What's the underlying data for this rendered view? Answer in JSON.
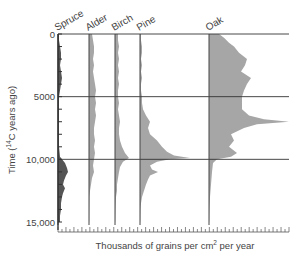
{
  "chart_data": {
    "type": "area",
    "subtype": "pollen-diagram",
    "title": "",
    "xlabel": "Thousands of grains per cm² per year",
    "xlabel_parts": {
      "before": "Thousands of grains per cm",
      "sup": "2",
      "after": " per year"
    },
    "ylabel": "Time (14C years ago)",
    "ylabel_parts": {
      "before": "Time (",
      "sup": "14",
      "after": "C years ago)"
    },
    "y_ticks": [
      {
        "value": 0,
        "label": "0"
      },
      {
        "value": 5000,
        "label": "5000"
      },
      {
        "value": 10000,
        "label": "10,000"
      },
      {
        "value": 15000,
        "label": "15,000"
      }
    ],
    "ylim": [
      0,
      15000
    ],
    "y_inverted": true,
    "grid_lines_at": [
      0,
      5000,
      10000
    ],
    "legend": "none",
    "series": [
      {
        "name": "Spruce",
        "color": "#555555",
        "baseline_px": 58,
        "depth": [
          0,
          500,
          1000,
          1500,
          2000,
          2500,
          3000,
          3500,
          4000,
          4500,
          5000,
          6000,
          7000,
          8000,
          9000,
          9800,
          10000,
          10300,
          10700,
          11000,
          11300,
          11700,
          12000,
          12300,
          12700,
          13000,
          13500,
          14000,
          14500,
          15000
        ],
        "values": [
          1,
          1,
          2,
          3,
          3,
          2,
          3,
          4,
          3,
          2,
          1,
          1,
          1,
          1,
          1,
          2,
          4,
          7,
          9,
          10,
          8,
          6,
          5,
          7,
          5,
          4,
          3,
          3,
          2,
          2
        ]
      },
      {
        "name": "Alder",
        "color": "#a6a6a6",
        "baseline_px": 89,
        "depth": [
          0,
          500,
          1000,
          1500,
          2000,
          2500,
          3000,
          3500,
          4000,
          4500,
          5000,
          5500,
          6000,
          6500,
          7000,
          7500,
          8000,
          8500,
          9000,
          9500,
          10000,
          10500,
          11000,
          11500,
          12000,
          12500,
          13000,
          14000,
          15000
        ],
        "values": [
          3,
          4,
          5,
          5,
          4,
          5,
          4,
          5,
          6,
          7,
          6,
          7,
          6,
          7,
          6,
          5,
          5,
          6,
          5,
          6,
          5,
          4,
          5,
          3,
          2,
          1,
          0.5,
          0.3,
          0.2
        ]
      },
      {
        "name": "Birch",
        "color": "#a6a6a6",
        "baseline_px": 115,
        "depth": [
          0,
          500,
          1000,
          1500,
          2000,
          2500,
          3000,
          3500,
          4000,
          4500,
          5000,
          5500,
          6000,
          6500,
          7000,
          7500,
          8000,
          8500,
          9000,
          9500,
          9900,
          10200,
          10600,
          11000,
          11500,
          12000,
          12500,
          13000,
          14000,
          15000
        ],
        "values": [
          3,
          3,
          4,
          3,
          4,
          3,
          4,
          3,
          4,
          3,
          3,
          4,
          3,
          4,
          5,
          4,
          4,
          5,
          7,
          10,
          14,
          8,
          5,
          4,
          3,
          2,
          2,
          1,
          0.5,
          0.2
        ]
      },
      {
        "name": "Pine",
        "color": "#a6a6a6",
        "baseline_px": 140,
        "depth": [
          0,
          500,
          1000,
          1500,
          2000,
          2500,
          3000,
          3500,
          4000,
          4500,
          5000,
          5500,
          6000,
          6500,
          7000,
          7500,
          8000,
          8500,
          9000,
          9400,
          9700,
          9900,
          10000,
          10200,
          10500,
          10800,
          11000,
          11300,
          11600,
          12000,
          12500,
          13000,
          13500,
          14000,
          15000
        ],
        "values": [
          1,
          1,
          2,
          2,
          1,
          2,
          1,
          2,
          1,
          1,
          2,
          2,
          3,
          6,
          10,
          8,
          10,
          17,
          22,
          27,
          34,
          50,
          30,
          17,
          10,
          12,
          18,
          10,
          8,
          6,
          4,
          2,
          1,
          0.5,
          0.2
        ]
      },
      {
        "name": "Oak",
        "color": "#a6a6a6",
        "baseline_px": 209,
        "depth": [
          0,
          300,
          700,
          1000,
          1500,
          2000,
          2500,
          3000,
          3500,
          4000,
          4500,
          5000,
          5500,
          6000,
          6500,
          6800,
          7000,
          7200,
          7500,
          8000,
          8500,
          9000,
          9500,
          9800,
          10000,
          10300,
          11000,
          12000,
          13000,
          14000,
          15000
        ],
        "values": [
          10,
          15,
          20,
          25,
          30,
          38,
          36,
          32,
          42,
          38,
          35,
          33,
          33,
          33,
          40,
          55,
          80,
          48,
          35,
          22,
          25,
          20,
          28,
          22,
          8,
          4,
          3,
          2,
          1,
          0.5,
          0.2
        ]
      }
    ],
    "x_axis": {
      "tick_count": 58,
      "major_every": 2,
      "range_px": [
        58,
        289
      ]
    }
  }
}
